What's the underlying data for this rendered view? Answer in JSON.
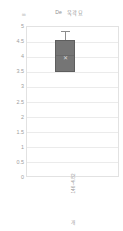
{
  "chart_data": {
    "type": "bar",
    "title": "De 욱곽묘",
    "title_parts": {
      "prefix": "De",
      "name": "욱곽묘"
    },
    "xlabel": "개",
    "ylabel": "",
    "y_unit": "㎜",
    "ylim": [
      0,
      5
    ],
    "grid": true,
    "legend": "none",
    "categories": [
      "146~4.82"
    ],
    "yticks": [
      "5",
      "4.5",
      "4",
      "3.5",
      "3",
      "2.5",
      "2",
      "1.5",
      "1",
      "0.5",
      "0"
    ],
    "ytick_values": [
      5,
      4.5,
      4,
      3.5,
      3,
      2.5,
      2,
      1.5,
      1,
      0.5,
      0
    ],
    "series": [
      {
        "name": "146~4.82",
        "box_bottom": 3.5,
        "box_top": 4.55,
        "median": 4.05,
        "mean": 3.95,
        "whisker_high": 4.85,
        "whisker_low": 3.5,
        "values": [
          4.55
        ]
      }
    ],
    "colors": {
      "box_fill": "#757575",
      "box_border": "#5e5e5e",
      "whisker": "#8c8c8c",
      "gridline": "#ebebeb",
      "plot_border": "#e2e2e2",
      "text": "#9d9d9d",
      "mean_marker": "#d8d8d8"
    },
    "mean_marker_glyph": "✕"
  }
}
